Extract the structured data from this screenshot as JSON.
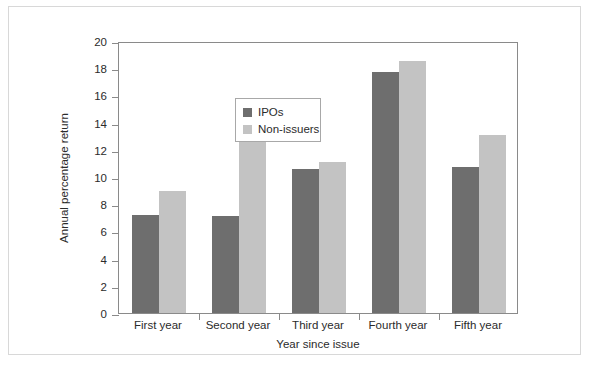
{
  "chart_data": {
    "type": "bar",
    "title": "",
    "xlabel": "Year since issue",
    "ylabel": "Annual percentage return",
    "categories": [
      "First year",
      "Second year",
      "Third year",
      "Fourth year",
      "Fifth year"
    ],
    "series": [
      {
        "name": "IPOs",
        "color": "#6e6e6e",
        "values": [
          7.2,
          7.1,
          10.6,
          17.7,
          10.7
        ]
      },
      {
        "name": "Non-issuers",
        "color": "#c3c3c3",
        "values": [
          9.0,
          12.8,
          11.1,
          18.5,
          13.1
        ]
      }
    ],
    "ylim": [
      0,
      20
    ],
    "yticks": [
      0,
      2,
      4,
      6,
      8,
      10,
      12,
      14,
      16,
      18,
      20
    ],
    "ytick_labels": [
      "0",
      "2",
      "4",
      "6",
      "8",
      "10",
      "12",
      "14",
      "16",
      "18",
      "20"
    ],
    "grid": false,
    "legend_position": "top-left"
  },
  "legend": {
    "entries": [
      {
        "label": "IPOs",
        "color": "#6e6e6e"
      },
      {
        "label": "Non-issuers",
        "color": "#c3c3c3"
      }
    ]
  },
  "axes": {
    "y_title": "Annual percentage return",
    "x_title": "Year since issue"
  },
  "colors": {
    "ipos": "#6e6e6e",
    "non_issuers": "#c3c3c3",
    "axis": "#8a8a8a",
    "text": "#2b2b2b",
    "page_frame": "#d8d8d8"
  }
}
